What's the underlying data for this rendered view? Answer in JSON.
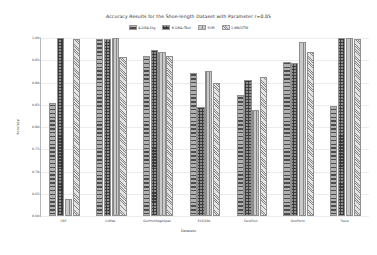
{
  "chart_data": {
    "type": "bar",
    "title": "Accuracy Results for the Shoe-length Dataset with Parameter r=0.05",
    "xlabel": "Datasets",
    "ylabel": "Accuracy",
    "ylim": [
      0.6,
      1.0
    ],
    "yticks": [
      "1.00",
      "0.95",
      "0.90",
      "0.85",
      "0.80",
      "0.75",
      "0.70",
      "0.65",
      "0.60"
    ],
    "ytick_values": [
      1.0,
      0.95,
      0.9,
      0.85,
      0.8,
      0.75,
      0.7,
      0.65,
      0.6
    ],
    "grid": true,
    "legend_position": "top-center",
    "categories": [
      "CBF",
      "Coffee",
      "GunPointAgeSpan",
      "ECG200",
      "FaceFour",
      "GunPoint",
      "Trace"
    ],
    "series": [
      {
        "name": "A-DBA-Stg",
        "values": [
          0.855,
          0.998,
          0.96,
          0.922,
          0.873,
          0.945,
          0.848
        ]
      },
      {
        "name": "B-DBA-ITest",
        "values": [
          1.0,
          0.998,
          0.972,
          0.845,
          0.905,
          0.943,
          1.0
        ]
      },
      {
        "name": "SVM",
        "values": [
          0.638,
          1.0,
          0.968,
          0.925,
          0.838,
          0.99,
          1.0
        ]
      },
      {
        "name": "1-NN/DTW",
        "values": [
          0.998,
          0.958,
          0.96,
          0.898,
          0.912,
          0.968,
          0.998
        ]
      }
    ],
    "colors": [
      "#b0b0b0",
      "#8e8e8e",
      "#c9c9c9",
      "#e2e2e2"
    ],
    "hatches": [
      "horizontal-lines",
      "cross-hatch",
      "vertical-lines",
      "diagonal-lines"
    ]
  }
}
